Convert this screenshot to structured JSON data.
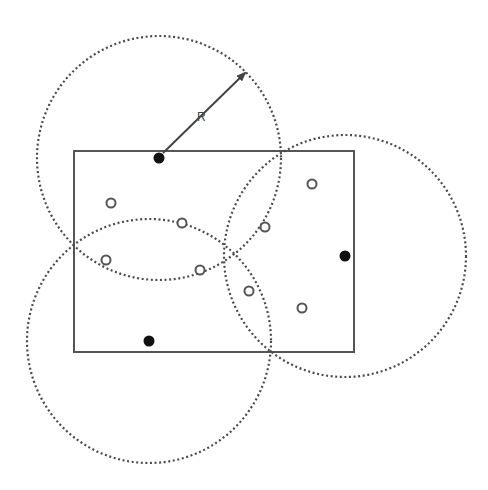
{
  "diagram": {
    "title": "",
    "colors": {
      "background": "#ffffff",
      "stroke": "#555555",
      "circle_dash": "#4a4a4a",
      "filled_dot": "#111111",
      "open_dot_stroke": "#555555"
    },
    "region": {
      "x": 74,
      "y": 151,
      "width": 280,
      "height": 201
    },
    "sensors": [
      {
        "id": "s1",
        "cx": 159,
        "cy": 158,
        "r": 122
      },
      {
        "id": "s2",
        "cx": 345,
        "cy": 256,
        "r": 121
      },
      {
        "id": "s3",
        "cx": 149,
        "cy": 341,
        "r": 122
      }
    ],
    "targets": [
      {
        "cx": 111,
        "cy": 203
      },
      {
        "cx": 182,
        "cy": 223
      },
      {
        "cx": 106,
        "cy": 260
      },
      {
        "cx": 200,
        "cy": 270
      },
      {
        "cx": 312,
        "cy": 184
      },
      {
        "cx": 265,
        "cy": 227
      },
      {
        "cx": 249,
        "cy": 291
      },
      {
        "cx": 302,
        "cy": 308
      }
    ],
    "radius_arrow": {
      "x1": 163,
      "y1": 153,
      "x2": 245,
      "y2": 73,
      "label": "R",
      "label_x": 197,
      "label_y": 121
    }
  }
}
